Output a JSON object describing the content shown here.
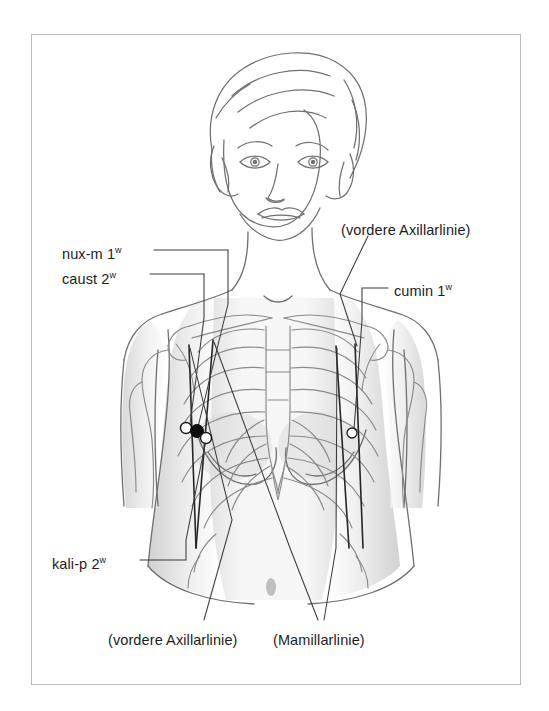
{
  "figure": {
    "frame": {
      "border_color": "#b9b9b9",
      "background": "#ffffff"
    },
    "line_color": "#6b6b6b",
    "shading_color": "#d5d5d5",
    "leader_color": "#3a3a3a"
  },
  "labels": [
    {
      "id": "nux-m",
      "text": "nux-m 1",
      "sup": "w",
      "x": 62,
      "y": 246
    },
    {
      "id": "caust",
      "text": "caust 2",
      "sup": "w",
      "x": 62,
      "y": 271
    },
    {
      "id": "kali-p",
      "text": "kali-p 2",
      "sup": "w",
      "x": 52,
      "y": 556
    },
    {
      "id": "cumin",
      "text": "cumin 1",
      "sup": "w",
      "x": 394,
      "y": 283
    },
    {
      "id": "vordere-axillarlinie-top",
      "text": "(vordere Axillarlinie)",
      "sup": "",
      "x": 341,
      "y": 223
    },
    {
      "id": "vordere-axillarlinie-bottom",
      "text": "(vordere Axillarlinie)",
      "sup": "",
      "x": 108,
      "y": 633
    },
    {
      "id": "mamillarlinie",
      "text": "(Mamillarlinie)",
      "sup": "",
      "x": 273,
      "y": 633
    }
  ],
  "markers": [
    {
      "id": "point-white-left",
      "type": "open",
      "x": 186,
      "y": 428,
      "r": 5.5
    },
    {
      "id": "point-black",
      "type": "filled",
      "x": 197,
      "y": 431,
      "r": 6.5
    },
    {
      "id": "point-white-lower",
      "type": "open",
      "x": 206,
      "y": 438,
      "r": 5.5
    },
    {
      "id": "point-white-right",
      "type": "open",
      "x": 352,
      "y": 433,
      "r": 5.0
    }
  ],
  "reference_lines": [
    {
      "id": "left-anterior-axillary-line",
      "x1": 189,
      "y1": 345,
      "x2": 196,
      "y2": 548
    },
    {
      "id": "left-mammillary-line",
      "x1": 213,
      "y1": 340,
      "x2": 196,
      "y2": 548
    },
    {
      "id": "right-mammillary-line",
      "x1": 336,
      "y1": 346,
      "x2": 349,
      "y2": 548
    },
    {
      "id": "right-anterior-axillary-line",
      "x1": 355,
      "y1": 344,
      "x2": 363,
      "y2": 548
    }
  ]
}
